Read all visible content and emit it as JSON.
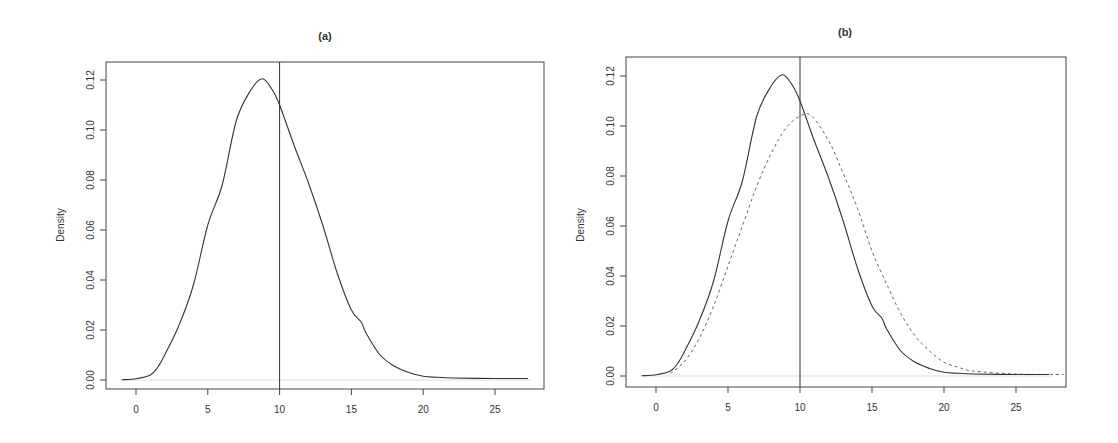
{
  "chart_data": [
    {
      "type": "line",
      "panel": "a",
      "title": "(a)",
      "xlabel": "",
      "ylabel": "Density",
      "xlim": [
        -2,
        28.5
      ],
      "ylim": [
        -0.004,
        0.125
      ],
      "x_ticks": [
        0,
        5,
        10,
        15,
        20,
        25
      ],
      "x_tick_labels": [
        "0",
        "5",
        "10",
        "15",
        "20",
        "25"
      ],
      "y_ticks": [
        0.0,
        0.02,
        0.04,
        0.06,
        0.08,
        0.1,
        0.12
      ],
      "y_tick_labels": [
        "0.00",
        "0.02",
        "0.04",
        "0.06",
        "0.08",
        "0.10",
        "0.12"
      ],
      "grid": false,
      "legend": null,
      "annotations": [
        {
          "type": "vline",
          "x": 10,
          "style": "solid"
        },
        {
          "type": "hline",
          "y": 0,
          "style": "light-gray"
        }
      ],
      "series": [
        {
          "name": "density",
          "style": "solid",
          "x": [
            -1,
            0,
            1,
            1.5,
            2,
            3,
            4,
            5,
            6,
            7,
            8,
            8.8,
            9.5,
            10,
            11,
            12,
            13,
            14,
            15,
            15.7,
            16,
            17,
            18,
            19,
            20,
            21,
            22,
            25,
            27.3
          ],
          "y": [
            0.0001,
            0.0005,
            0.002,
            0.005,
            0.01,
            0.022,
            0.038,
            0.062,
            0.078,
            0.104,
            0.116,
            0.1205,
            0.116,
            0.11,
            0.094,
            0.079,
            0.062,
            0.043,
            0.028,
            0.023,
            0.019,
            0.01,
            0.0055,
            0.003,
            0.0015,
            0.0011,
            0.0008,
            0.0006,
            0.0006
          ]
        }
      ]
    },
    {
      "type": "line",
      "panel": "b",
      "title": "(b)",
      "xlabel": "",
      "ylabel": "Density",
      "xlim": [
        -2,
        28.5
      ],
      "ylim": [
        -0.004,
        0.125
      ],
      "x_ticks": [
        0,
        5,
        10,
        15,
        20,
        25
      ],
      "x_tick_labels": [
        "0",
        "5",
        "10",
        "15",
        "20",
        "25"
      ],
      "y_ticks": [
        0.0,
        0.02,
        0.04,
        0.06,
        0.08,
        0.1,
        0.12
      ],
      "y_tick_labels": [
        "0.00",
        "0.02",
        "0.04",
        "0.06",
        "0.08",
        "0.10",
        "0.12"
      ],
      "grid": false,
      "legend": null,
      "annotations": [
        {
          "type": "vline",
          "x": 10,
          "style": "solid"
        },
        {
          "type": "hline",
          "y": 0,
          "style": "light-gray"
        }
      ],
      "series": [
        {
          "name": "density (solid)",
          "style": "solid",
          "x": [
            -1,
            0,
            1,
            1.5,
            2,
            3,
            4,
            5,
            6,
            7,
            8,
            8.8,
            9.5,
            10,
            11,
            12,
            13,
            14,
            15,
            15.7,
            16,
            17,
            18,
            19,
            20,
            21,
            22,
            25,
            27.3
          ],
          "y": [
            0.0001,
            0.0005,
            0.002,
            0.005,
            0.01,
            0.022,
            0.038,
            0.062,
            0.078,
            0.104,
            0.116,
            0.1205,
            0.116,
            0.11,
            0.094,
            0.079,
            0.062,
            0.043,
            0.028,
            0.023,
            0.019,
            0.01,
            0.0055,
            0.003,
            0.0015,
            0.0011,
            0.0008,
            0.0006,
            0.0006
          ]
        },
        {
          "name": "density (dashed)",
          "style": "dashed",
          "x": [
            1,
            2,
            3,
            4,
            5,
            6,
            7,
            8,
            9,
            10,
            10.8,
            12,
            13,
            14,
            15,
            16,
            17,
            18,
            19,
            20,
            21,
            22,
            25,
            28.3
          ],
          "y": [
            0.001,
            0.006,
            0.015,
            0.028,
            0.044,
            0.06,
            0.076,
            0.089,
            0.099,
            0.104,
            0.104,
            0.094,
            0.081,
            0.067,
            0.05,
            0.037,
            0.025,
            0.016,
            0.01,
            0.0055,
            0.0035,
            0.002,
            0.0008,
            0.0006
          ]
        }
      ]
    }
  ],
  "panels": [
    {
      "title": "(a)",
      "ylabel": "Density"
    },
    {
      "title": "(b)",
      "ylabel": "Density"
    }
  ]
}
